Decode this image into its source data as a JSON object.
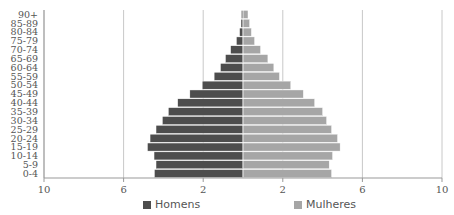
{
  "chart_data": {
    "type": "bar",
    "orientation": "horizontal-pyramid",
    "title": "",
    "categories": [
      "0-4",
      "5-9",
      "10-14",
      "15-19",
      "20-24",
      "25-29",
      "30-34",
      "35-39",
      "40-44",
      "45-49",
      "50-54",
      "55-59",
      "60-64",
      "65-69",
      "70-74",
      "75-79",
      "80-84",
      "85-89",
      "90+"
    ],
    "series": [
      {
        "name": "Homens",
        "side": "left",
        "color": "#4d4d4d",
        "values": [
          4.45,
          4.37,
          4.47,
          4.8,
          4.67,
          4.37,
          4.05,
          3.75,
          3.28,
          2.67,
          2.05,
          1.45,
          1.13,
          0.88,
          0.62,
          0.33,
          0.17,
          0.1,
          0.08
        ]
      },
      {
        "name": "Mulheres",
        "side": "right",
        "color": "#a6a6a6",
        "values": [
          4.45,
          4.33,
          4.5,
          4.88,
          4.75,
          4.45,
          4.2,
          4.0,
          3.6,
          3.03,
          2.4,
          1.83,
          1.55,
          1.25,
          0.88,
          0.58,
          0.42,
          0.33,
          0.25
        ]
      }
    ],
    "xaxis": {
      "ticks": [
        -10,
        -6,
        -2,
        2,
        6,
        10
      ],
      "tick_labels": [
        "10",
        "6",
        "2",
        "2",
        "6",
        "10"
      ],
      "range": [
        -10,
        10
      ]
    },
    "xlabel": "",
    "ylabel": "",
    "grid": true,
    "legend": "bottom"
  },
  "legend": {
    "homens": "Homens",
    "mulheres": "Mulheres"
  }
}
